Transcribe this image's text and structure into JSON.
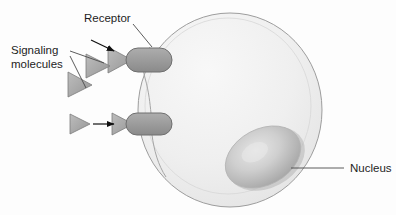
{
  "figure": {
    "background_color": "#fdfdfd"
  },
  "labels": {
    "receptor": "Receptor",
    "signaling_line1": "Signaling",
    "signaling_line2": "molecules",
    "nucleus": "Nucleus"
  },
  "colors": {
    "cell_fill": "#eeeeee",
    "cell_fill_light": "#f7f7f7",
    "cell_outline": "#9d9d9d",
    "nucleus_fill": "#c9c9c9",
    "nucleus_highlight": "#e3e3e3",
    "nucleus_shadow": "#a6a6a6",
    "receptor_fill": "#9b9b9b",
    "receptor_outline": "#6f6f6f",
    "ligand_fill": "#a8a8a8",
    "ligand_outline": "#7c7c7c",
    "arrow_black": "#111111",
    "leader_line": "#4a4a4a",
    "text": "#1d1d1d"
  },
  "structures": {
    "cell": {
      "name": "cell-body",
      "cx": 230,
      "cy": 110,
      "rx": 92,
      "ry": 97
    },
    "nucleus": {
      "name": "nucleus",
      "cx": 263,
      "cy": 157,
      "rx": 40,
      "ry": 28,
      "rotation_deg": -28
    },
    "receptors": [
      {
        "name": "receptor-upper",
        "x": 126,
        "y": 48,
        "width": 46,
        "height": 24
      },
      {
        "name": "receptor-lower",
        "x": 126,
        "y": 113,
        "width": 46,
        "height": 22
      }
    ],
    "ligands": [
      {
        "name": "ligand-bound-upper",
        "cx": 123,
        "cy": 60,
        "bound": true
      },
      {
        "name": "ligand-free-upper",
        "cx": 99,
        "cy": 66,
        "bound": false
      },
      {
        "name": "ligand-free-lower",
        "cx": 81,
        "cy": 84,
        "bound": false
      },
      {
        "name": "ligand-bound-lower",
        "cx": 124,
        "cy": 124,
        "bound": true
      },
      {
        "name": "ligand-approaching-lower",
        "cx": 80,
        "cy": 124,
        "bound": false
      }
    ]
  },
  "annotations": {
    "receptor_arrow": {
      "name": "receptor-pointer-arrow",
      "x1": 91,
      "y1": 40,
      "x2": 116,
      "y2": 52
    },
    "binding_arrow": {
      "name": "binding-direction-arrow",
      "x1": 92,
      "y1": 124,
      "x2": 116,
      "y2": 124
    },
    "receptor_leader": {
      "name": "receptor-leader-line",
      "x1": 134,
      "y1": 23,
      "x2": 152,
      "y2": 47
    },
    "signaling_leader_a": {
      "name": "signaling-leader-line-a",
      "x1": 69,
      "y1": 51,
      "x2": 104,
      "y2": 62
    },
    "signaling_leader_b": {
      "name": "signaling-leader-line-b",
      "x1": 69,
      "y1": 56,
      "x2": 86,
      "y2": 88
    },
    "nucleus_leader": {
      "name": "nucleus-leader-line",
      "x1": 291,
      "y1": 168,
      "x2": 344,
      "y2": 168
    }
  },
  "text_positions": {
    "receptor": {
      "x": 84,
      "y": 22
    },
    "signaling_line1": {
      "x": 11,
      "y": 54
    },
    "signaling_line2": {
      "x": 11,
      "y": 68
    },
    "nucleus": {
      "x": 350,
      "y": 172
    }
  }
}
